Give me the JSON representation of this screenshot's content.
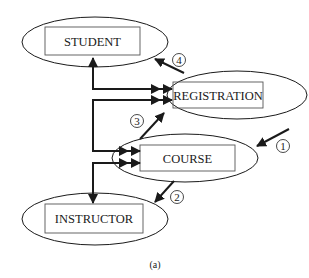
{
  "diagram": {
    "type": "entity-relationship access-path",
    "nodes": [
      {
        "id": "student",
        "label": "STUDENT"
      },
      {
        "id": "registration",
        "label": "REGISTRATION"
      },
      {
        "id": "course",
        "label": "COURSE"
      },
      {
        "id": "instructor",
        "label": "INSTRUCTOR"
      }
    ],
    "edges": [
      {
        "from": "registration",
        "to": "student",
        "style": "bracket-line"
      },
      {
        "from": "course",
        "to": "registration",
        "style": "bracket-line"
      },
      {
        "from": "course",
        "to": "instructor",
        "style": "bracket-line"
      }
    ],
    "steps": [
      {
        "number": "1",
        "glyph": "①",
        "target": "course"
      },
      {
        "number": "2",
        "glyph": "②",
        "from": "course",
        "target": "instructor"
      },
      {
        "number": "3",
        "glyph": "③",
        "from": "course",
        "target": "registration"
      },
      {
        "number": "4",
        "glyph": "④",
        "from": "registration",
        "target": "student"
      }
    ],
    "caption": "(a)",
    "colors": {
      "stroke": "#1a1a1a",
      "box": "#555555",
      "background": "#ffffff"
    }
  }
}
